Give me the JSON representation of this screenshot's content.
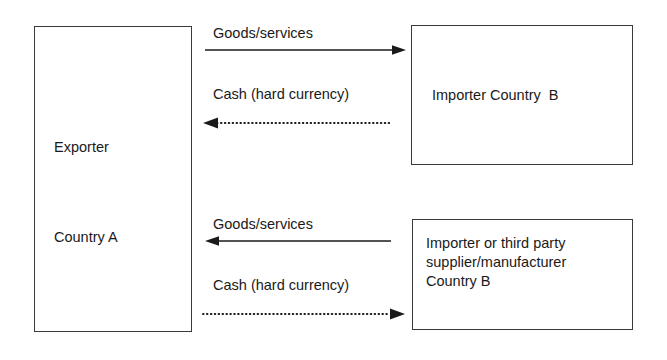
{
  "diagram": {
    "boxes": [
      {
        "id": "exporter",
        "lines": [
          "Exporter",
          "Country A"
        ],
        "line1": "Exporter",
        "line2": "Country A"
      },
      {
        "id": "importer-country-b",
        "line1": "Importer Country  B"
      },
      {
        "id": "importer-third-party",
        "line1": "Importer or third party",
        "line2": "supplier/manufacturer",
        "line3": "Country B"
      }
    ],
    "flows": [
      {
        "id": "goods-services-top",
        "label": "Goods/services",
        "direction": "right",
        "style": "solid"
      },
      {
        "id": "cash-hard-currency-top",
        "label": "Cash (hard currency)",
        "direction": "left",
        "style": "dotted"
      },
      {
        "id": "goods-services-bottom",
        "label": "Goods/services",
        "direction": "left",
        "style": "solid"
      },
      {
        "id": "cash-hard-currency-bottom",
        "label": "Cash (hard currency)",
        "direction": "right",
        "style": "dotted"
      }
    ],
    "colors": {
      "ink": "#1a1a1a",
      "border": "#3a3a3a",
      "background": "#ffffff"
    }
  }
}
